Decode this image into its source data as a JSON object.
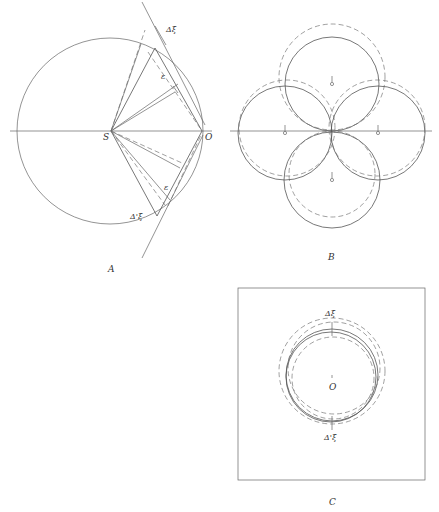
{
  "figure": {
    "panels": [
      {
        "id": "A",
        "caption": "A",
        "labels": {
          "center": "S",
          "origin": "O",
          "delta_xi": "Δξ",
          "delta_prime_xi": "Δ'ξ",
          "epsilon_upper": "ε",
          "epsilon_lower": "ε"
        }
      },
      {
        "id": "B",
        "caption": "B",
        "labels": {
          "markers": [
            "o",
            "o",
            "o",
            "o"
          ]
        }
      },
      {
        "id": "C",
        "caption": "C",
        "labels": {
          "delta_xi": "Δξ",
          "center": "O",
          "delta_prime_xi": "Δ'ξ"
        }
      }
    ]
  }
}
